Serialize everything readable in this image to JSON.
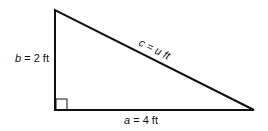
{
  "diagram": {
    "type": "right-triangle",
    "labels": {
      "side_b": {
        "var": "b",
        "rest": " = 2 ft"
      },
      "side_a": {
        "var": "a",
        "rest": " = 4 ft"
      },
      "side_c": {
        "var": "c",
        "eq": " = ",
        "var2": "u",
        "unit": " ft"
      }
    },
    "colors": {
      "stroke": "#111111",
      "background": "#ffffff"
    }
  }
}
